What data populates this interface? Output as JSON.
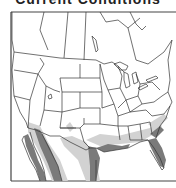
{
  "title": "Current Conditions",
  "map": {
    "region": "Contiguous United States with southern Canada and northern Mexico",
    "legend_colors": {
      "dark_shade": "#7a7a7a",
      "light_shade": "#cfcfcf",
      "borders": "#333333",
      "background": "#ffffff"
    },
    "shaded_areas": [
      "Baja California peninsula",
      "Sonora / Arizona border",
      "Southern Texas / Rio Grande",
      "Gulf Coast (Louisiana)",
      "Florida peninsula",
      "Georgia / Carolina coast"
    ]
  }
}
